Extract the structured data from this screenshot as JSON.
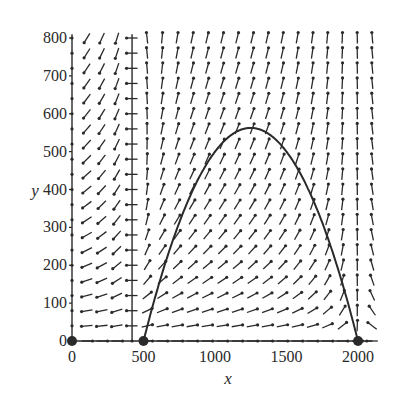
{
  "chart_data": {
    "type": "direction_field",
    "title": "",
    "xlabel": "x",
    "ylabel": "y",
    "xlim": [
      0,
      2100
    ],
    "ylim": [
      0,
      800
    ],
    "xticks": [
      0,
      500,
      1000,
      1500,
      2000
    ],
    "yticks": [
      0,
      100,
      200,
      300,
      400,
      500,
      600,
      700,
      800
    ],
    "grid": false,
    "legend": null,
    "field": {
      "description": "Slope field arrows on a regular grid; arrows point leftward/down left of x~420, upward-right between curve and x-axis, upward-left beyond x=2000",
      "x_step": 105,
      "y_step": 40
    },
    "nullcline_vertical_x": 420,
    "curve": {
      "name": "trajectory",
      "equation": "y = 0.001*(x-500)*(2000-x)",
      "x_range": [
        500,
        2000
      ],
      "peak": [
        1250,
        562.5
      ]
    },
    "equilibria": [
      [
        0,
        0
      ],
      [
        500,
        0
      ],
      [
        2000,
        0
      ]
    ]
  },
  "axes": {
    "x_label": "x",
    "y_label": "y",
    "x_tick_labels": [
      "0",
      "500",
      "1000",
      "1500",
      "2000"
    ],
    "y_tick_labels": [
      "0",
      "100",
      "200",
      "300",
      "400",
      "500",
      "600",
      "700",
      "800"
    ]
  },
  "colors": {
    "ink": "#2a2a2a",
    "background": "#ffffff"
  }
}
